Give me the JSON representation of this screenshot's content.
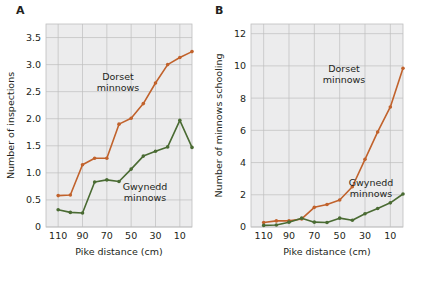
{
  "figure": {
    "background": "#ffffff",
    "plot_background": "#ececed",
    "gridline_color": "#bfbfbf",
    "text_color": "#231f20"
  },
  "colors": {
    "dorset": "#c1622c",
    "gwynedd": "#4a6b33"
  },
  "panels": [
    {
      "id": "panel-a",
      "label": "A",
      "chart_data": {
        "type": "line",
        "title": "",
        "xlabel": "Pike distance (cm)",
        "ylabel": "Number of inspections",
        "xticks": [
          110,
          90,
          70,
          50,
          30,
          10
        ],
        "xticklabels": [
          "110",
          "90",
          "70",
          "50",
          "30",
          "10"
        ],
        "yticks": [
          0,
          0.5,
          1.0,
          1.5,
          2.0,
          2.5,
          3.0,
          3.5
        ],
        "yticklabels": [
          "0",
          "0.5",
          "1.0",
          "1.5",
          "2.0",
          "2.5",
          "3.0",
          "3.5"
        ],
        "xlim": [
          120,
          0
        ],
        "ylim": [
          0,
          3.75
        ],
        "x_inverted": true,
        "grid": true,
        "legend": "annotations",
        "x": [
          110,
          100,
          90,
          80,
          70,
          60,
          50,
          40,
          30,
          20,
          10,
          0
        ],
        "series": [
          {
            "name": "Dorset minnows",
            "color": "#c1622c",
            "annotation": "Dorset\nminnows",
            "values": [
              0.58,
              0.59,
              1.15,
              1.27,
              1.27,
              1.9,
              2.01,
              2.28,
              2.66,
              3.0,
              3.13,
              3.24
            ]
          },
          {
            "name": "Gwynedd minnows",
            "color": "#4a6b33",
            "annotation": "Gwynedd\nminnows",
            "values": [
              0.32,
              0.27,
              0.26,
              0.83,
              0.87,
              0.84,
              1.07,
              1.31,
              1.4,
              1.48,
              1.97,
              1.47
            ]
          }
        ]
      }
    },
    {
      "id": "panel-b",
      "label": "B",
      "chart_data": {
        "type": "line",
        "title": "",
        "xlabel": "Pike distance (cm)",
        "ylabel": "Number of minnows schooling",
        "xticks": [
          110,
          90,
          70,
          50,
          30,
          10
        ],
        "xticklabels": [
          "110",
          "90",
          "70",
          "50",
          "30",
          "10"
        ],
        "yticks": [
          0,
          2,
          4,
          6,
          8,
          10,
          12
        ],
        "yticklabels": [
          "0",
          "2",
          "4",
          "6",
          "8",
          "10",
          "12"
        ],
        "xlim": [
          120,
          0
        ],
        "ylim": [
          0,
          12.6
        ],
        "x_inverted": true,
        "grid": true,
        "legend": "annotations",
        "x": [
          110,
          100,
          90,
          80,
          70,
          60,
          50,
          40,
          30,
          20,
          10,
          0
        ],
        "series": [
          {
            "name": "Dorset minnows",
            "color": "#c1622c",
            "annotation": "Dorset\nminnows",
            "values": [
              0.28,
              0.38,
              0.38,
              0.5,
              1.22,
              1.4,
              1.68,
              2.5,
              4.2,
              5.9,
              7.45,
              9.85
            ]
          },
          {
            "name": "Gwynedd minnows",
            "color": "#4a6b33",
            "annotation": "Gwynedd\nminnows",
            "values": [
              0.1,
              0.12,
              0.3,
              0.55,
              0.3,
              0.28,
              0.55,
              0.42,
              0.82,
              1.15,
              1.5,
              2.05
            ]
          }
        ]
      }
    }
  ]
}
